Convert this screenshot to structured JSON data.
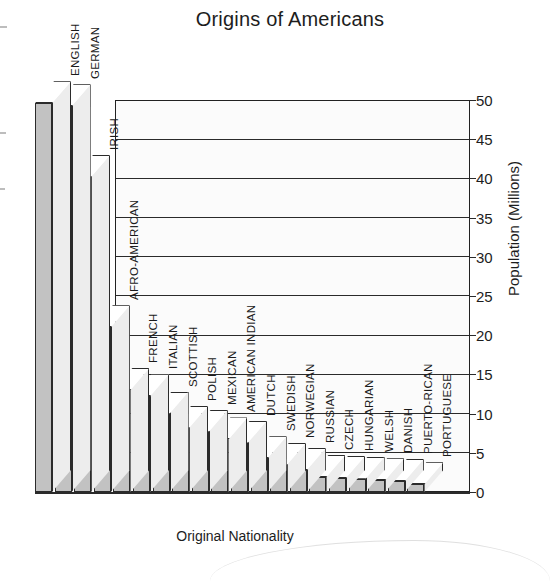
{
  "chart_data": {
    "type": "bar",
    "title": "Origins of Americans",
    "xlabel": "Original Nationality",
    "ylabel": "Population (Millions)",
    "ylim": [
      0,
      50
    ],
    "yticks": [
      0,
      5,
      10,
      15,
      20,
      25,
      30,
      35,
      40,
      45,
      50
    ],
    "grid": true,
    "legend": "none",
    "style": "3d-isometric-bar",
    "categories": [
      "ENGLISH",
      "GERMAN",
      "IRISH",
      "AFRO-AMERICAN",
      "FRENCH",
      "ITALIAN",
      "SCOTTISH",
      "POLISH",
      "MEXICAN",
      "AMERICAN INDIAN",
      "DUTCH",
      "SWEDISH",
      "NORWEGIAN",
      "RUSSIAN",
      "CZECH",
      "HUNGARIAN",
      "WELSH",
      "DANISH",
      "PUERTO-RICAN",
      "PORTUGUESE"
    ],
    "values": [
      49.6,
      49.2,
      40.2,
      21.0,
      13.0,
      12.2,
      10.0,
      8.2,
      7.7,
      6.7,
      6.3,
      4.3,
      3.5,
      2.8,
      1.9,
      1.8,
      1.7,
      1.5,
      1.4,
      1.0
    ]
  },
  "colors": {
    "bar_face": "#c2c2c2",
    "bar_top": "#ffffff",
    "bar_side": "#ededed",
    "outline": "#2b2b2b",
    "plot_background": "#fbfbfb",
    "text": "#1a1a1a"
  }
}
